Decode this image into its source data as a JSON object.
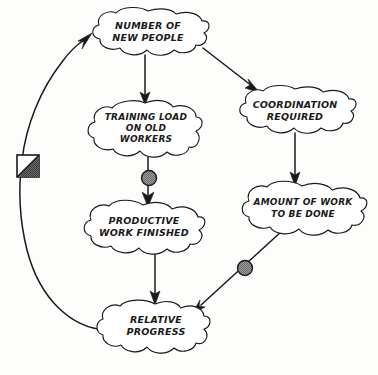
{
  "diagram": {
    "style": "hand-drawn cloud nodes with arrows",
    "colors": {
      "ink": "#1a1a1a",
      "paper": "#fdfdfc",
      "node_fill": "#ffffff",
      "delay_marker_gray": "#909090"
    },
    "nodes": [
      {
        "id": "new-people",
        "lines": [
          "NUMBER OF",
          "NEW PEOPLE"
        ],
        "line1": "NUMBER OF",
        "line2": "NEW PEOPLE",
        "line3": "",
        "cx": 148,
        "cy": 33,
        "rx": 57,
        "ry": 22
      },
      {
        "id": "coordination",
        "lines": [
          "COORDINATION",
          "REQUIRED"
        ],
        "line1": "COORDINATION",
        "line2": "REQUIRED",
        "line3": "",
        "cx": 295,
        "cy": 111,
        "rx": 57,
        "ry": 22
      },
      {
        "id": "training-load",
        "lines": [
          "TRAINING LOAD",
          "ON OLD",
          "WORKERS"
        ],
        "line1": "TRAINING LOAD",
        "line2": "ON OLD",
        "line3": "WORKERS",
        "cx": 145,
        "cy": 129,
        "rx": 52,
        "ry": 27
      },
      {
        "id": "amount-of-work",
        "lines": [
          "AMOUNT OF WORK",
          "TO BE DONE"
        ],
        "line1": "AMOUNT OF WORK",
        "line2": "TO BE DONE",
        "line3": "",
        "cx": 302,
        "cy": 208,
        "rx": 60,
        "ry": 22
      },
      {
        "id": "productive-work",
        "lines": [
          "PRODUCTIVE",
          "WORK FINISHED"
        ],
        "line1": "PRODUCTIVE",
        "line2": "WORK FINISHED",
        "line3": "",
        "cx": 143,
        "cy": 228,
        "rx": 57,
        "ry": 23
      },
      {
        "id": "relative-progress",
        "lines": [
          "RELATIVE",
          "PROGRESS"
        ],
        "line1": "RELATIVE",
        "line2": "PROGRESS",
        "line3": "",
        "cx": 155,
        "cy": 327,
        "rx": 50,
        "ry": 23
      }
    ],
    "links": [
      {
        "id": "new-people-to-training-load",
        "from": "new-people",
        "to": "training-load",
        "kind": "straight-vertical"
      },
      {
        "id": "new-people-to-coordination",
        "from": "new-people",
        "to": "coordination",
        "kind": "diagonal"
      },
      {
        "id": "coordination-to-amount-of-work",
        "from": "coordination",
        "to": "amount-of-work",
        "kind": "straight-vertical"
      },
      {
        "id": "training-load-to-productive-work",
        "from": "training-load",
        "to": "productive-work",
        "kind": "straight-vertical-with-delay"
      },
      {
        "id": "productive-work-to-relative-progress",
        "from": "productive-work",
        "to": "relative-progress",
        "kind": "straight-vertical"
      },
      {
        "id": "amount-of-work-to-relative-progress",
        "from": "amount-of-work",
        "to": "relative-progress",
        "kind": "diagonal-with-delay"
      },
      {
        "id": "relative-progress-to-new-people",
        "from": "relative-progress",
        "to": "new-people",
        "kind": "feedback-loop-with-square-delay"
      }
    ],
    "markers": [
      {
        "id": "delay-circle-training",
        "type": "delay-circle",
        "on_link": "training-load-to-productive-work",
        "x": 149,
        "y": 178,
        "r": 7.5
      },
      {
        "id": "delay-circle-work",
        "type": "delay-circle",
        "on_link": "amount-of-work-to-relative-progress",
        "x": 245,
        "y": 268,
        "r": 7.5
      },
      {
        "id": "delay-square",
        "type": "delay-square-half-filled",
        "on_link": "relative-progress-to-new-people",
        "x": 28,
        "y": 166,
        "size": 22
      }
    ]
  }
}
